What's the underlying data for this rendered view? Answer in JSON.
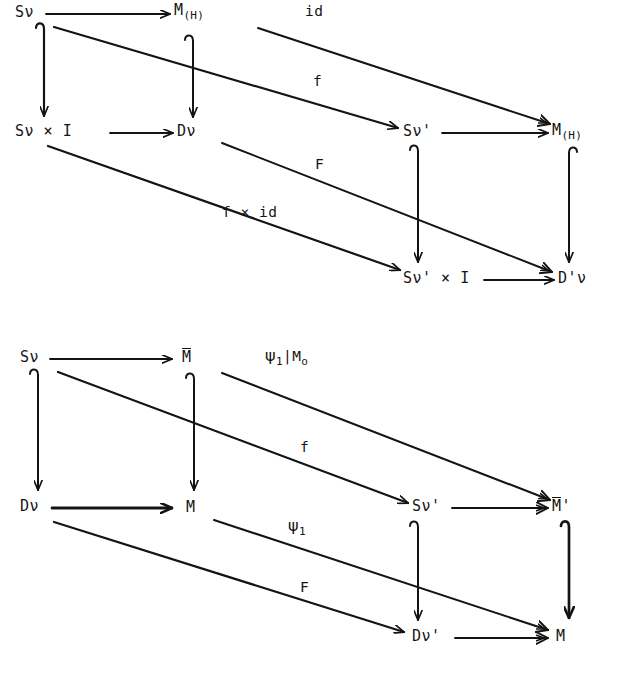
{
  "figure": {
    "kind": "commutative-diagram-pair",
    "background": "#ffffff",
    "ink": "#141414",
    "width": 637,
    "height": 682
  },
  "diagram1": {
    "nodes": {
      "top_left": "Sν",
      "top_mid": "M",
      "top_mid_sub": "(H)",
      "top_right": "M",
      "top_right_sub": "(H)",
      "top_back_right": "Sν'",
      "bottom_left": "Sν × I",
      "bottom_mid": "Dν",
      "bottom_back_mid": "Sν' × I",
      "bottom_back_right": "D'ν"
    },
    "edge_labels": {
      "id": "id",
      "f_top": "f",
      "F": "F",
      "f_times_id": "f × id"
    }
  },
  "diagram2": {
    "nodes": {
      "top_left": "Sν",
      "top_mid": "M",
      "top_right": "M",
      "top_back_right": "Sν'",
      "bottom_left": "Dν",
      "bottom_mid": "M",
      "bottom_back_mid": "Dν'",
      "bottom_back_right": "M"
    },
    "edge_labels": {
      "psi1_restricted": "ψ₁|Mₒ",
      "psi1_restricted_parts": {
        "psi": "ψ",
        "sub": "1",
        "bar": "|",
        "M": "M",
        "Msub": "o"
      },
      "f_top": "f",
      "psi1": "ψ₁",
      "psi1_parts": {
        "psi": "ψ",
        "sub": "1"
      },
      "F": "F"
    }
  }
}
